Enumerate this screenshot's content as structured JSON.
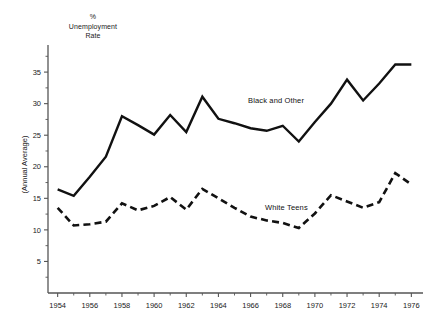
{
  "axis_title": {
    "line1": "%",
    "line2": "Unemployment",
    "line3": "Rate"
  },
  "ylabel": "(Annual Average)",
  "labels": {
    "black_and_other": "Black and Other",
    "white_teens": "White Teens"
  },
  "colors": {
    "line": "#111111",
    "axis": "#555555",
    "text": "#1a1a1a",
    "background": "#ffffff"
  },
  "chart_data": {
    "type": "line",
    "title": "",
    "subtitle": "",
    "xlabel": "",
    "ylabel": "% Unemployment Rate (Annual Average)",
    "xlim": [
      1953.4,
      1976.6
    ],
    "ylim": [
      0,
      38.5
    ],
    "grid": false,
    "legend_position": "inline-annotation",
    "x": [
      1954,
      1955,
      1956,
      1957,
      1958,
      1959,
      1960,
      1961,
      1962,
      1963,
      1964,
      1965,
      1966,
      1967,
      1968,
      1969,
      1970,
      1971,
      1972,
      1973,
      1974,
      1975,
      1976
    ],
    "yticks": [
      5,
      10,
      15,
      20,
      25,
      30,
      35
    ],
    "ytick_labels": [
      "5",
      "10",
      "15",
      "20",
      "25",
      "30",
      "35"
    ],
    "xticks_major": [
      1954,
      1956,
      1958,
      1960,
      1962,
      1964,
      1966,
      1968,
      1970,
      1972,
      1974,
      1976
    ],
    "xtick_labels": [
      "1954",
      "1956",
      "1958",
      "1960",
      "1962",
      "1964",
      "1966",
      "1968",
      "1970",
      "1972",
      "1974",
      "1976"
    ],
    "xticks_minor": [
      1955,
      1957,
      1959,
      1961,
      1963,
      1965,
      1967,
      1969,
      1971,
      1973,
      1975
    ],
    "series": [
      {
        "name": "Black and Other",
        "style": "solid",
        "values": [
          16.4,
          15.4,
          18.4,
          21.6,
          28.0,
          26.6,
          25.1,
          28.2,
          25.5,
          31.1,
          27.6,
          26.9,
          26.1,
          25.7,
          26.5,
          24.0,
          27.1,
          30.0,
          33.8,
          30.5,
          33.2,
          36.2,
          36.2
        ]
      },
      {
        "name": "White Teens",
        "style": "dashed",
        "values": [
          13.5,
          10.7,
          10.9,
          11.3,
          14.2,
          13.1,
          13.8,
          15.2,
          13.2,
          16.5,
          15.0,
          13.5,
          12.1,
          11.5,
          11.1,
          10.3,
          12.6,
          15.5,
          14.5,
          13.5,
          14.4,
          19.0,
          17.2
        ]
      }
    ]
  }
}
